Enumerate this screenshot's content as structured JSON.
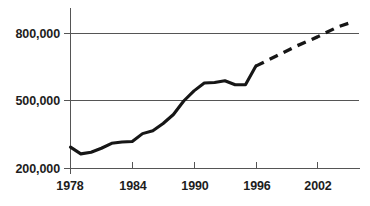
{
  "chart_data": {
    "type": "line",
    "title": "",
    "subtitle": "",
    "xlabel": "",
    "ylabel": "",
    "xlim": [
      1977,
      1006
    ],
    "x_axis_range": [
      1977,
      2006
    ],
    "ylim": [
      200000,
      860000
    ],
    "grid": "horizontal",
    "legend": "none",
    "y_ticks": [
      200000,
      500000,
      800000
    ],
    "y_tick_labels": [
      "200,000",
      "500,000",
      "800,000"
    ],
    "x_ticks": [
      1978,
      1984,
      1990,
      1996,
      2002
    ],
    "x_tick_labels": [
      "1978",
      "1984",
      "1990",
      "1996",
      "2002"
    ],
    "series": [
      {
        "name": "actual",
        "style": "solid",
        "color": "#161616",
        "x": [
          1978,
          1979,
          1980,
          1981,
          1982,
          1983,
          1984,
          1985,
          1986,
          1987,
          1988,
          1989,
          1990,
          1991,
          1992,
          1993,
          1994,
          1995,
          1996
        ],
        "values": [
          295000,
          265000,
          272000,
          290000,
          312000,
          318000,
          320000,
          355000,
          368000,
          400000,
          440000,
          500000,
          545000,
          580000,
          582000,
          590000,
          572000,
          572000,
          655000
        ]
      },
      {
        "name": "projected",
        "style": "dashed",
        "color": "#161616",
        "x": [
          1996,
          1998,
          2000,
          2002,
          2004,
          2005
        ],
        "values": [
          655000,
          700000,
          745000,
          785000,
          830000,
          845000
        ]
      }
    ]
  },
  "axes": {
    "y_labels": [
      "800,000",
      "500,000",
      "200,000"
    ],
    "x_labels": [
      "1978",
      "1984",
      "1990",
      "1996",
      "2002"
    ]
  },
  "colors": {
    "series": "#161616",
    "axis": "#555555",
    "background": "#ffffff",
    "text": "#1d1d1d"
  }
}
